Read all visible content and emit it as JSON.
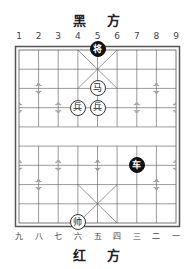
{
  "board": {
    "top_side_label": "黑 方",
    "bottom_side_label": "红 方",
    "top_file_numbers": [
      "1",
      "2",
      "3",
      "4",
      "5",
      "6",
      "7",
      "8",
      "9"
    ],
    "bottom_file_numbers": [
      "九",
      "八",
      "七",
      "六",
      "五",
      "四",
      "三",
      "二",
      "一"
    ],
    "colors": {
      "line": "#555555",
      "black_piece": "#111111",
      "red_piece_fill": "#ffffff"
    }
  },
  "pieces": [
    {
      "side": "black",
      "label": "将",
      "name": "black-general",
      "col": 5,
      "row": 0
    },
    {
      "side": "red",
      "label": "马",
      "name": "red-horse",
      "col": 5,
      "row": 2
    },
    {
      "side": "red",
      "label": "兵",
      "name": "red-soldier",
      "col": 4,
      "row": 3
    },
    {
      "side": "red",
      "label": "兵",
      "name": "red-soldier",
      "col": 5,
      "row": 3
    },
    {
      "side": "black",
      "label": "车",
      "name": "black-chariot",
      "col": 7,
      "row": 6
    },
    {
      "side": "red",
      "label": "帅",
      "name": "red-general",
      "col": 4,
      "row": 9
    }
  ]
}
